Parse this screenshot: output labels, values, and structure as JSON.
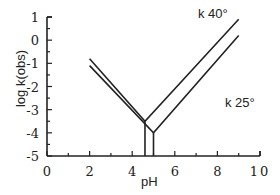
{
  "chart_data": {
    "type": "line",
    "title": "",
    "xlabel": "pH",
    "ylabel": "log k(obs)",
    "xlim": [
      0,
      10
    ],
    "ylim": [
      -5,
      1
    ],
    "xticks": [
      "0",
      "2",
      "4",
      "6",
      "8",
      "10"
    ],
    "yticks": [
      "1",
      "0",
      "-1",
      "-2",
      "-3",
      "-4",
      "-5"
    ],
    "grid": false,
    "series": [
      {
        "name": "k 40°",
        "x": [
          2,
          4.6,
          9
        ],
        "y": [
          -0.8,
          -3.5,
          0.9
        ],
        "drop_line_x": 4.6
      },
      {
        "name": "k 25°",
        "x": [
          2,
          5.0,
          9
        ],
        "y": [
          -1.1,
          -4.0,
          0.2
        ],
        "drop_line_x": 5.0
      }
    ],
    "annotations": [
      "k 40°",
      "k 25°"
    ]
  }
}
